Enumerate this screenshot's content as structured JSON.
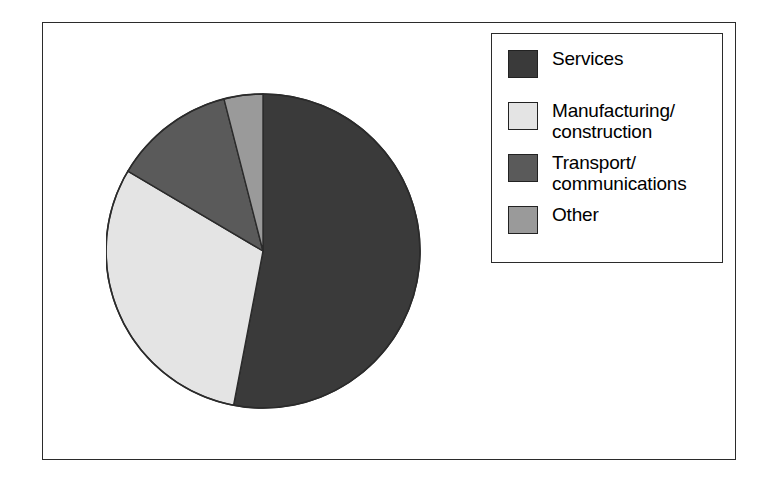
{
  "figure": {
    "background_color": "#ffffff",
    "frame_color": "#2b2b2b"
  },
  "legend": {
    "position": "top-right",
    "border_color": "#2b2b2b",
    "entries": [
      {
        "label": "Services",
        "color": "#3a3a3a"
      },
      {
        "label": "Manufacturing/\nconstruction",
        "color": "#e4e4e4"
      },
      {
        "label": "Transport/\ncommunications",
        "color": "#5a5a5a"
      },
      {
        "label": "Other",
        "color": "#9a9a9a"
      }
    ]
  },
  "chart_data": {
    "type": "pie",
    "title": "",
    "subtitle": "",
    "xlabel": "",
    "ylabel": "",
    "grid": false,
    "legend_position": "top-right",
    "start_angle_deg": 0,
    "direction": "clockwise",
    "outline_color": "#2b2b2b",
    "labels": [
      "Services",
      "Manufacturing/construction",
      "Transport/communications",
      "Other"
    ],
    "values": [
      53,
      30.5,
      12.5,
      4
    ],
    "unit": "percent",
    "colors": [
      "#3a3a3a",
      "#e4e4e4",
      "#5a5a5a",
      "#9a9a9a"
    ],
    "slices": [
      {
        "label": "Services",
        "value": 53,
        "color": "#3a3a3a",
        "start_deg": 0,
        "end_deg": 190.8
      },
      {
        "label": "Manufacturing/construction",
        "value": 30.5,
        "color": "#e4e4e4",
        "start_deg": 190.8,
        "end_deg": 300.6
      },
      {
        "label": "Transport/communications",
        "value": 12.5,
        "color": "#5a5a5a",
        "start_deg": 300.6,
        "end_deg": 345.6
      },
      {
        "label": "Other",
        "value": 4,
        "color": "#9a9a9a",
        "start_deg": 345.6,
        "end_deg": 360
      }
    ],
    "geometry": {
      "cx": 157,
      "cy": 179,
      "r": 157
    }
  }
}
